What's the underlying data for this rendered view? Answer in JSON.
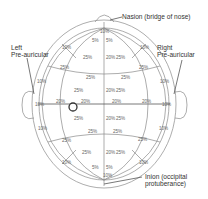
{
  "diagram": {
    "labels": {
      "nasion": "Nasion (bridge of nose)",
      "left_pre_auricular": [
        "Left",
        "Pre-auricular"
      ],
      "right_pre_auricular": [
        "Right",
        "Pre-auricular"
      ],
      "inion": [
        "Inion (occipital",
        "protuberance)"
      ]
    },
    "percentages": {
      "top_10": "10%",
      "top_5_left": "5%",
      "top_5_right": "5%",
      "upper_left_10": "10%",
      "upper_right_10": "10%",
      "upper_left_25a": "25%",
      "upper_mid_20": "20%",
      "upper_mid_25": "25%",
      "upper_left_25b": "25%",
      "upper_right_25b": "25%",
      "upper_row_left_25": "25%",
      "upper_row_right_25": "25%",
      "left_10_upper": "10%",
      "right_10_upper": "10%",
      "mid_upper_left_25": "25%",
      "mid_upper_center_20": "20%",
      "mid_upper_center_25": "25%",
      "mid_left_10": "10%",
      "mid_20_a": "20%",
      "mid_20_b": "20%",
      "mid_20_c": "20%",
      "mid_20_d": "20%",
      "mid_right_10": "10%",
      "mid_lower_left_25": "25%",
      "mid_lower_center_20": "20%",
      "mid_lower_center_25": "25%",
      "left_10_lower": "10%",
      "right_10_lower": "10%",
      "lower_row_left_25": "25%",
      "lower_row_right_25": "25%",
      "lower_left_25a": "25%",
      "lower_right_25a": "25%",
      "lower_left_25b": "25%",
      "lower_mid_20": "20%",
      "lower_mid_25": "25%",
      "lower_left_10": "10%",
      "lower_right_10": "10%",
      "bottom_5_left": "5%",
      "bottom_5_right": "5%",
      "bottom_10": "10%"
    }
  }
}
